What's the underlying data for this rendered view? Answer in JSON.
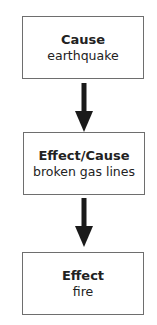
{
  "diagram": {
    "type": "cause-effect flowchart",
    "nodes": [
      {
        "title": "Cause",
        "text": "earthquake"
      },
      {
        "title": "Effect/Cause",
        "text": "broken gas lines"
      },
      {
        "title": "Effect",
        "text": "fire"
      }
    ],
    "edges": [
      {
        "from": 0,
        "to": 1,
        "direction": "down"
      },
      {
        "from": 1,
        "to": 2,
        "direction": "down"
      }
    ],
    "colors": {
      "border": "#6e6e6e",
      "arrow": "#1a1a1a",
      "text": "#222222"
    }
  }
}
